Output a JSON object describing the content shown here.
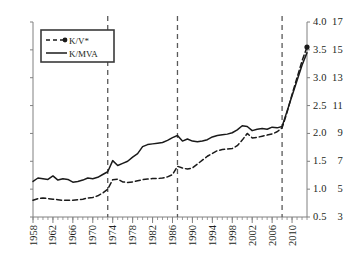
{
  "chart_data": {
    "type": "line",
    "title": "",
    "xlabel": "",
    "ylabel": "",
    "y2label": "",
    "grid": false,
    "legend_position": "top-left",
    "x": [
      1958,
      1959,
      1960,
      1961,
      1962,
      1963,
      1964,
      1965,
      1966,
      1967,
      1968,
      1969,
      1970,
      1971,
      1972,
      1973,
      1974,
      1975,
      1976,
      1977,
      1978,
      1979,
      1980,
      1981,
      1982,
      1983,
      1984,
      1985,
      1986,
      1987,
      1988,
      1989,
      1990,
      1991,
      1992,
      1993,
      1994,
      1995,
      1996,
      1997,
      1998,
      1999,
      2000,
      2001,
      2002,
      2003,
      2004,
      2005,
      2006,
      2007,
      2008,
      2009,
      2010,
      2011,
      2012,
      2013
    ],
    "xlim": [
      1958,
      2013
    ],
    "xticks": [
      1958,
      1962,
      1966,
      1970,
      1974,
      1978,
      1982,
      1986,
      1990,
      1994,
      1998,
      2002,
      2006,
      2010
    ],
    "xticklabels": [
      "1958",
      "1962",
      "1966",
      "1970",
      "1974",
      "1978",
      "1982",
      "1986",
      "1990",
      "1994",
      "1998",
      "2002",
      "2006",
      "2010"
    ],
    "xminortick_step": 1,
    "ylim": [
      3,
      17
    ],
    "yticks": [
      3,
      5,
      7,
      9,
      11,
      13,
      15,
      17
    ],
    "yticklabels": [
      "3",
      "5",
      "7",
      "9",
      "11",
      "13",
      "15",
      "17"
    ],
    "y2lim": [
      0.5,
      4.0
    ],
    "y2ticks": [
      0.5,
      1.0,
      1.5,
      2.0,
      2.5,
      3.0,
      3.5,
      4.0
    ],
    "y2ticklabels": [
      "0.5",
      "1.0",
      "1.5",
      "2.0",
      "2.5",
      "3.0",
      "3.5",
      "4.0"
    ],
    "vlines": [
      1973,
      1987,
      2008
    ],
    "series": [
      {
        "name": "K/V*",
        "axis": "right",
        "style": "dashed",
        "color": "#1a1a1a",
        "marker_at_end": true,
        "values": [
          0.8,
          0.83,
          0.84,
          0.83,
          0.82,
          0.81,
          0.8,
          0.8,
          0.8,
          0.81,
          0.82,
          0.84,
          0.85,
          0.88,
          0.93,
          1.0,
          1.17,
          1.18,
          1.13,
          1.12,
          1.13,
          1.15,
          1.17,
          1.18,
          1.19,
          1.19,
          1.2,
          1.22,
          1.26,
          1.41,
          1.38,
          1.36,
          1.38,
          1.45,
          1.52,
          1.59,
          1.64,
          1.69,
          1.71,
          1.72,
          1.73,
          1.78,
          1.88,
          2.0,
          1.92,
          1.93,
          1.95,
          1.97,
          1.99,
          2.03,
          2.1,
          2.38,
          2.7,
          3.0,
          3.3,
          3.55
        ]
      },
      {
        "name": "K/MVA",
        "axis": "left",
        "style": "solid",
        "color": "#1a1a1a",
        "marker_at_end": false,
        "values": [
          5.55,
          5.8,
          5.75,
          5.7,
          5.95,
          5.65,
          5.75,
          5.7,
          5.5,
          5.55,
          5.65,
          5.8,
          5.75,
          5.85,
          6.05,
          6.25,
          7.05,
          6.7,
          6.85,
          7.0,
          7.3,
          7.55,
          8.05,
          8.2,
          8.25,
          8.3,
          8.35,
          8.5,
          8.7,
          8.85,
          8.45,
          8.6,
          8.45,
          8.4,
          8.45,
          8.55,
          8.75,
          8.85,
          8.9,
          8.95,
          9.05,
          9.25,
          9.55,
          9.5,
          9.2,
          9.3,
          9.35,
          9.3,
          9.45,
          9.4,
          9.5,
          10.6,
          11.7,
          12.8,
          13.9,
          14.8
        ]
      }
    ]
  },
  "legend": {
    "entries": [
      {
        "label": "K/V*",
        "style": "dashed",
        "marker": true
      },
      {
        "label": "K/MVA",
        "style": "solid",
        "marker": false
      }
    ]
  },
  "colors": {
    "line": "#1a1a1a",
    "axis": "#808080",
    "vline": "#595959",
    "text": "#231f20",
    "background": "#ffffff"
  }
}
